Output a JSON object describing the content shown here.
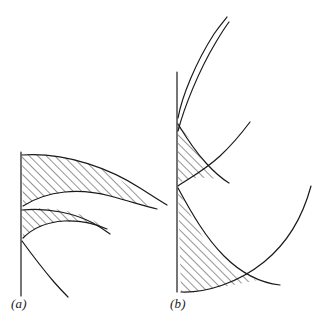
{
  "figure": {
    "background_color": "#ffffff",
    "stroke_color": "#1a1a1a",
    "hatch_color": "#2b2b2b",
    "width": 335,
    "height": 326,
    "panels": [
      {
        "id": "a",
        "caption": "(a)",
        "caption_position": {
          "x": 11,
          "y": 296
        },
        "axis": {
          "x": 21,
          "y_top": 152,
          "y_bottom": 296
        },
        "hatched_regions": 2,
        "curves": 5
      },
      {
        "id": "b",
        "caption": "(b)",
        "caption_position": {
          "x": 170,
          "y": 296
        },
        "axis": {
          "x": 177,
          "y_top": 72,
          "y_bottom": 292
        },
        "hatched_regions": 2,
        "curves": 6
      }
    ]
  },
  "geometry": {
    "panel_a": {
      "axis_line": "M21,152 L21,296",
      "region_upper_outline": "M22,155 C60,152 98,163 122,181 C139,194 150,203 156,207 C146,206 128,201 108,196 C78,188 46,192 23,206 Z",
      "region_lower_outline": "M22,210 C42,206 66,209 84,216 C95,221 102,225 106,228 C96,225 80,221 62,222 C46,223 32,229 23,238 Z",
      "curve_top_outer": "M22,155 C68,152 112,170 140,188 C154,197 162,202 167,205",
      "curve_top_inner": "M23,206 C48,190 80,188 110,196 C132,202 148,207 157,209",
      "curve_mid_outer": "M22,210 C48,207 76,214 93,223 C102,228 107,232 110,234",
      "curve_mid_inner": "M23,238 C33,228 48,222 64,221 C82,220 98,225 107,229",
      "curve_lower": "M22,241 C30,252 42,268 54,282 C61,290 65,294 68,297"
    },
    "panel_b": {
      "axis_line": "M177,72 L177,292",
      "region_mid_outline": "M178,124 C186,133 194,145 200,156 C206,167 212,174 217,179 C206,177 192,177 183,181 C180,183 179,184 178,186 Z",
      "region_lower_outline": "M178,188 C186,206 196,228 210,248 C224,268 240,278 258,280 C240,284 216,288 198,291 C190,292 184,292 181,292 Z",
      "curve_b_steep_outer": "M178,118 C182,96 196,62 214,34 C221,24 225,20 227,17",
      "curve_b_steep_inner": "M178,131 C184,108 198,72 216,42 C222,32 226,26 229,22",
      "curve_b_cusp_upper": "M178,124 C187,139 196,152 206,163 C216,174 224,180 229,183",
      "curve_b_mid_inner": "M178,186 C190,178 206,169 220,156 C234,143 244,130 250,122",
      "curve_b_lower_inner": "M178,188 C192,214 206,238 224,256 C242,274 262,283 280,285",
      "curve_b_outer_arc": "M181,292 C206,293 238,283 264,262 C290,241 304,212 311,186"
    }
  }
}
